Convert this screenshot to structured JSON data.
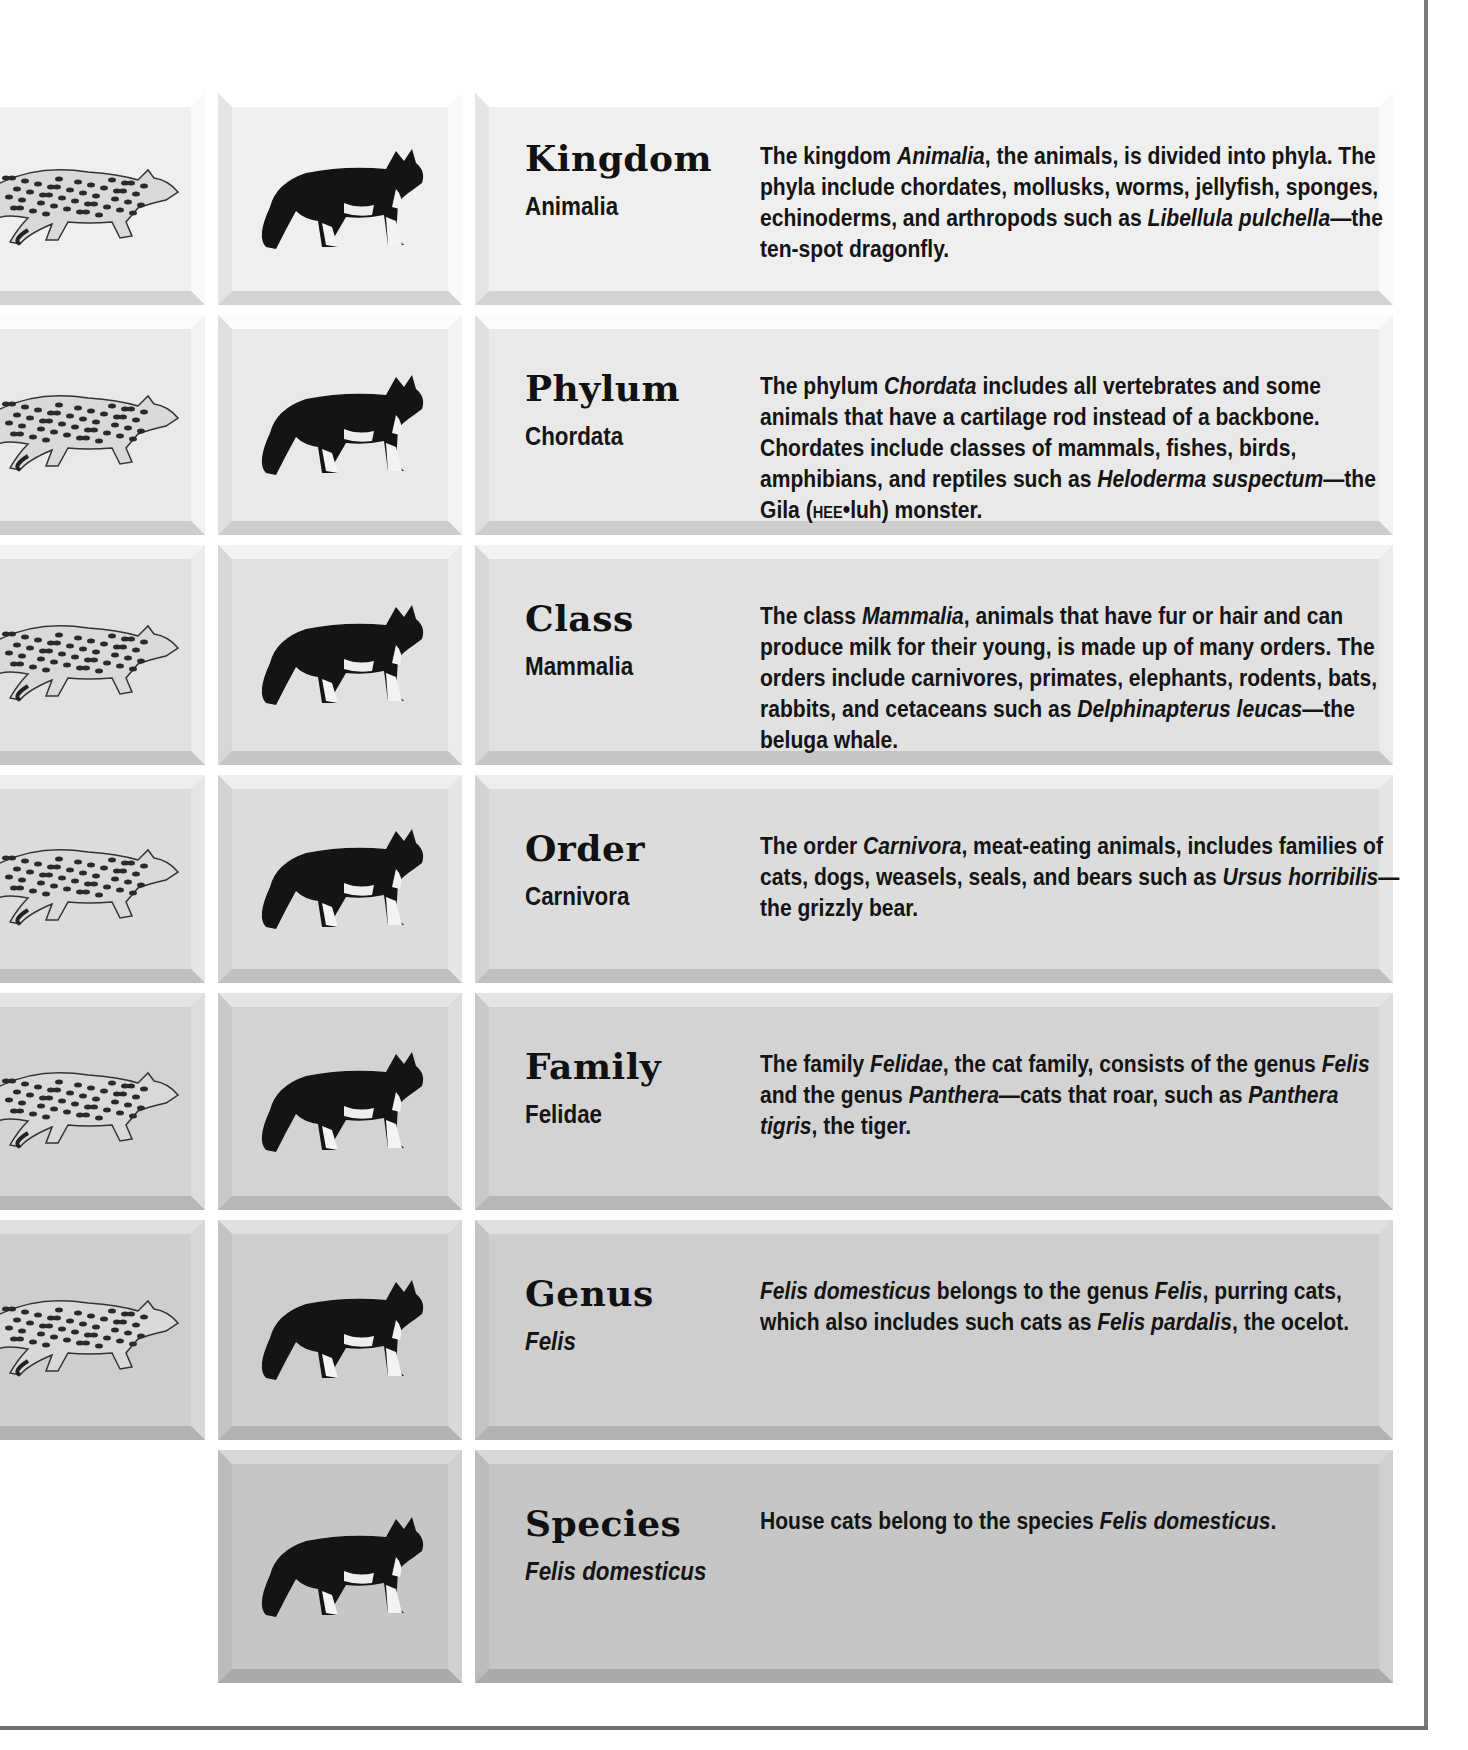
{
  "page": {
    "colors": {
      "row_shades": [
        "#efefef",
        "#e9e9e9",
        "#e1e1e1",
        "#dcdcdc",
        "#d3d3d3",
        "#cecece",
        "#c6c6c6"
      ],
      "text": "#141414",
      "frame": "#777777"
    }
  },
  "rows": [
    {
      "rank": "Kingdom",
      "name": "Animalia",
      "name_italic": false,
      "has_ocelot": true,
      "description": [
        {
          "t": "The kingdom "
        },
        {
          "t": "Animalia",
          "i": true
        },
        {
          "t": ", the animals, is divided into phyla. The phyla include chordates, mollusks, worms, jellyfish, sponges, echinoderms, and arthropods such as "
        },
        {
          "t": "Libellula pulchella",
          "i": true
        },
        {
          "t": "—the ten-spot dragonfly."
        }
      ]
    },
    {
      "rank": "Phylum",
      "name": "Chordata",
      "name_italic": false,
      "has_ocelot": true,
      "description": [
        {
          "t": "The phylum "
        },
        {
          "t": "Chordata",
          "i": true
        },
        {
          "t": " includes all vertebrates and some animals that have a cartilage rod instead of a backbone. Chordates include classes of mammals, fishes, birds, amphibians, and reptiles such as "
        },
        {
          "t": "Heloderma suspectum",
          "i": true
        },
        {
          "t": "—the Gila ("
        },
        {
          "t": "HEE",
          "sc": true
        },
        {
          "t": "•luh) monster."
        }
      ]
    },
    {
      "rank": "Class",
      "name": "Mammalia",
      "name_italic": false,
      "has_ocelot": true,
      "description": [
        {
          "t": "The class "
        },
        {
          "t": "Mammalia",
          "i": true
        },
        {
          "t": ", animals that have fur or hair and can produce milk for their young, is made up of many orders. The orders include carnivores, primates, elephants, rodents, bats, rabbits, and cetaceans such as "
        },
        {
          "t": "Delphinapterus leucas",
          "i": true
        },
        {
          "t": "—the beluga whale."
        }
      ]
    },
    {
      "rank": "Order",
      "name": "Carnivora",
      "name_italic": false,
      "has_ocelot": true,
      "description": [
        {
          "t": "The order "
        },
        {
          "t": "Carnivora",
          "i": true
        },
        {
          "t": ", meat-eating animals, includes families of cats, dogs, weasels, seals, and bears such as "
        },
        {
          "t": "Ursus horribilis",
          "i": true
        },
        {
          "t": "—the grizzly bear."
        }
      ]
    },
    {
      "rank": "Family",
      "name": "Felidae",
      "name_italic": false,
      "has_ocelot": true,
      "description": [
        {
          "t": "The family "
        },
        {
          "t": "Felidae",
          "i": true
        },
        {
          "t": ", the cat family, consists of the genus "
        },
        {
          "t": "Felis",
          "i": true
        },
        {
          "t": " and the genus "
        },
        {
          "t": "Panthera",
          "i": true
        },
        {
          "t": "—cats that roar, such as "
        },
        {
          "t": "Panthera tigris",
          "i": true
        },
        {
          "t": ", the tiger."
        }
      ]
    },
    {
      "rank": "Genus",
      "name": "Felis",
      "name_italic": true,
      "has_ocelot": true,
      "description": [
        {
          "t": "Felis domesticus",
          "i": true
        },
        {
          "t": " belongs to the genus "
        },
        {
          "t": "Felis",
          "i": true
        },
        {
          "t": ", purring cats, which also includes such cats as "
        },
        {
          "t": "Felis pardalis",
          "i": true
        },
        {
          "t": ", the ocelot."
        }
      ]
    },
    {
      "rank": "Species",
      "name": "Felis domesticus",
      "name_italic": true,
      "has_ocelot": false,
      "description": [
        {
          "t": "House cats belong to the species "
        },
        {
          "t": "Felis domesticus",
          "i": true
        },
        {
          "t": "."
        }
      ]
    }
  ],
  "icons": {
    "ocelot": "ocelot-illustration",
    "house_cat": "house-cat-illustration"
  }
}
